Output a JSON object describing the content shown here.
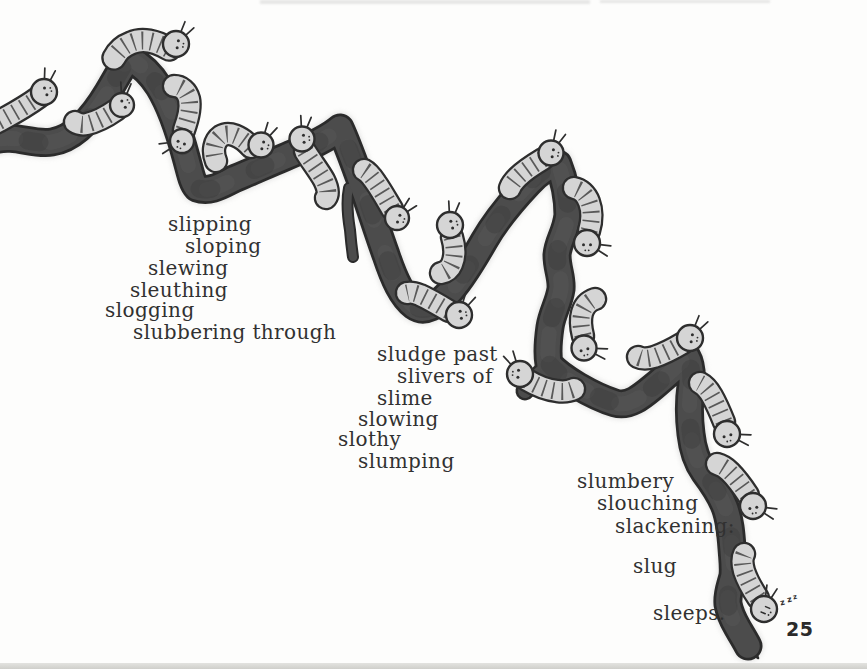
{
  "page": {
    "number": "25",
    "snore": "zzz"
  },
  "poem": {
    "stanza1": [
      "slipping",
      "sloping",
      "slewing",
      "sleuthing",
      "slogging",
      "slubbering through"
    ],
    "stanza2": [
      "sludge past",
      "slivers of",
      "slime",
      "slowing",
      "slothy",
      "slumping"
    ],
    "stanza3": [
      "slumbery",
      "slouching",
      "slackening:",
      "slug",
      "sleeps."
    ]
  },
  "illustration": {
    "colors": {
      "paper": "#fdfdfc",
      "branch_fill": "#4c4c4c",
      "branch_outline": "#2b2b2b",
      "branch_halo": "#c6c6c6",
      "texture_light": "#616161",
      "texture_dark": "#353535",
      "slug_fill": "#d5d5d5",
      "slug_outline": "#2e2e2e",
      "slug_stripe": "#3a3a3a",
      "ink": "#313131"
    },
    "branch": {
      "main": "M -6 140 C 15 134 32 145 52 142 C 72 139 90 122 108 92 C 117 77 123 65 129 58 C 140 64 151 74 159 87 C 170 105 179 131 186 157 C 190 171 192 183 197 188 C 211 193 223 184 236 178 C 253 171 268 164 285 157 C 301 150 325 141 340 128 C 347 143 353 160 361 182 C 369 204 377 230 386 255 C 394 279 402 297 414 306 C 425 314 437 305 448 294 C 459 283 472 262 484 241 C 496 220 512 201 529 183 C 539 172 550 166 558 164 C 564 179 568 197 568 215 C 566 233 558 241 557 255 C 557 269 562 277 561 289 C 559 303 552 313 550 327 C 548 341 547 353 549 364 C 557 373 566 379 578 386 C 590 393 602 399 615 403 C 629 407 641 397 653 387 C 664 378 677 366 687 357 C 691 364 692 374 691 386 C 689 400 689 418 691 434 C 693 452 697 462 704 472 C 713 484 720 494 725 507 C 730 520 731 534 732 548 C 733 562 734 568 733 576 C 730 588 727 594 728 604 C 730 616 735 623 740 632 C 743 637 746 642 748 646",
      "tip": "M 736 633 C 741 644 748 652 758 658 C 753 648 751 638 750 628 Z",
      "twig": "M 349 188 C 346 202 348 218 350 230 C 351 242 352 250 353 257",
      "spur": "M 551 365 C 540 372 532 381 525 391"
    },
    "slugs": [
      {
        "h": [
          44,
          92
        ],
        "r": 13,
        "ant": -75,
        "face": -20,
        "body": "M 39 97 C 28 105 16 112 5 118 C 0 121 -6 124 -12 126"
      },
      {
        "h": [
          122,
          105
        ],
        "r": 12,
        "ant": -80,
        "face": -30,
        "body": "M 116 110 C 106 117 96 122 87 124 C 82 125 78 124 75 122"
      },
      {
        "h": [
          176,
          44
        ],
        "r": 13,
        "ant": -55,
        "face": 10,
        "bw": 21,
        "body": "M 169 49 C 156 41 142 38 131 43 C 123 46 117 52 114 58"
      },
      {
        "h": [
          182,
          141
        ],
        "r": 12,
        "ant": 160,
        "face": 115,
        "body": "M 184 130 C 188 119 191 108 189 99 C 187 91 181 86 174 86"
      },
      {
        "h": [
          261,
          145
        ],
        "r": 12.5,
        "ant": -60,
        "face": 15,
        "body": "M 251 147 C 241 136 229 131 221 136 C 214 141 212 151 216 161"
      },
      {
        "h": [
          302,
          139
        ],
        "r": 12.5,
        "ant": -80,
        "face": -5,
        "body": "M 305 151 C 311 161 319 171 324 180 C 328 188 329 194 326 198"
      },
      {
        "h": [
          397,
          218
        ],
        "r": 12,
        "ant": -45,
        "face": 20,
        "body": "M 392 209 C 386 199 381 190 376 183 C 372 177 368 172 364 170"
      },
      {
        "h": [
          459,
          315
        ],
        "r": 13,
        "ant": -60,
        "face": -10,
        "body": "M 449 311 C 439 305 429 299 420 295 C 415 293 411 292 407 293"
      },
      {
        "h": [
          450,
          225
        ],
        "r": 13,
        "ant": -80,
        "face": -15,
        "body": "M 452 237 C 455 247 455 257 452 264 C 450 269 446 272 441 273"
      },
      {
        "h": [
          551,
          153
        ],
        "r": 12.5,
        "ant": -65,
        "face": 10,
        "body": "M 543 159 C 533 165 524 171 518 177 C 514 181 511 185 510 188"
      },
      {
        "h": [
          587,
          243
        ],
        "r": 13,
        "ant": 20,
        "face": 90,
        "body": "M 589 231 C 592 221 592 210 589 202 C 586 194 580 189 574 188"
      },
      {
        "h": [
          584,
          348
        ],
        "r": 12.5,
        "ant": 15,
        "face": 75,
        "body": "M 583 336 C 581 328 580 320 582 313 C 584 306 589 301 595 299"
      },
      {
        "h": [
          520,
          374
        ],
        "r": 13,
        "ant": -120,
        "face": 185,
        "body": "M 527 380 C 537 386 547 390 557 391 C 564 392 570 391 574 389"
      },
      {
        "h": [
          690,
          338
        ],
        "r": 13,
        "ant": -55,
        "face": 10,
        "body": "M 683 343 C 673 349 663 354 654 357 C 647 359 642 359 638 357"
      },
      {
        "h": [
          727,
          434
        ],
        "r": 13,
        "ant": 15,
        "face": 75,
        "body": "M 724 422 C 720 412 716 403 712 396 C 708 389 704 385 700 383"
      },
      {
        "h": [
          753,
          506
        ],
        "r": 13,
        "ant": 20,
        "face": 80,
        "body": "M 748 495 C 742 486 736 478 730 472 C 726 468 721 465 717 464"
      },
      {
        "h": [
          764,
          609
        ],
        "r": 13,
        "ant": -70,
        "face": 40,
        "sleep": true,
        "body": "M 758 598 C 752 589 747 580 744 571 C 742 564 742 558 744 554"
      }
    ]
  }
}
